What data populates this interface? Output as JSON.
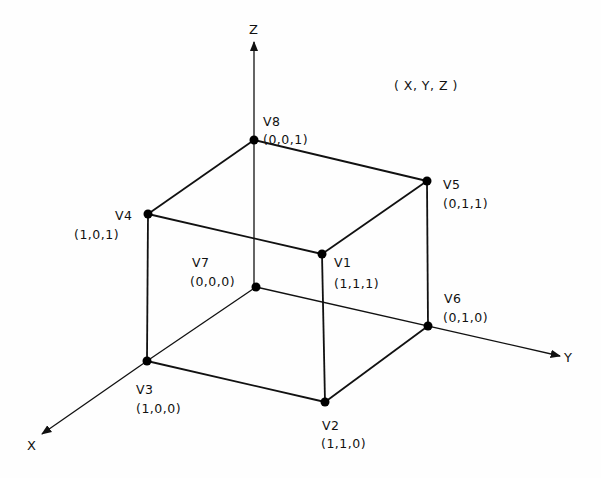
{
  "diagram": {
    "title_note": "( X, Y, Z )",
    "axes": [
      {
        "name": "X",
        "label": "X",
        "from": [
          256,
          287
        ],
        "to": [
          40,
          435
        ],
        "label_pos": [
          32,
          448
        ]
      },
      {
        "name": "Y",
        "label": "Y",
        "from": [
          256,
          287
        ],
        "to": [
          562,
          357
        ],
        "label_pos": [
          575,
          362
        ]
      },
      {
        "name": "Z",
        "label": "Z",
        "from": [
          254,
          287
        ],
        "to": [
          254,
          40
        ],
        "label_pos": [
          254,
          32
        ]
      }
    ],
    "vertices": [
      {
        "id": "V1",
        "label": "V1",
        "coords": "(1,1,1)",
        "pos": [
          322,
          254
        ]
      },
      {
        "id": "V2",
        "label": "V2",
        "coords": "(1,1,0)",
        "pos": [
          327,
          402
        ]
      },
      {
        "id": "V3",
        "label": "V3",
        "coords": "(1,0,0)",
        "pos": [
          147,
          361
        ]
      },
      {
        "id": "V4",
        "label": "V4",
        "coords": "(1,0,1)",
        "pos": [
          148,
          214
        ]
      },
      {
        "id": "V5",
        "label": "V5",
        "coords": "(0,1,1)",
        "pos": [
          427,
          181
        ]
      },
      {
        "id": "V6",
        "label": "V6",
        "coords": "(0,1,0)",
        "pos": [
          428,
          326
        ]
      },
      {
        "id": "V7",
        "label": "V7",
        "coords": "(0,0,0)",
        "pos": [
          256,
          287
        ]
      },
      {
        "id": "V8",
        "label": "V8",
        "coords": "(0,0,1)",
        "pos": [
          254,
          140
        ]
      }
    ],
    "edges": [
      [
        "V8",
        "V5"
      ],
      [
        "V8",
        "V4"
      ],
      [
        "V4",
        "V1"
      ],
      [
        "V1",
        "V5"
      ],
      [
        "V4",
        "V3"
      ],
      [
        "V1",
        "V2"
      ],
      [
        "V5",
        "V6"
      ],
      [
        "V3",
        "V2"
      ],
      [
        "V2",
        "V6"
      ]
    ],
    "colors": {
      "line": "#111111",
      "background": "#fefefe"
    }
  }
}
